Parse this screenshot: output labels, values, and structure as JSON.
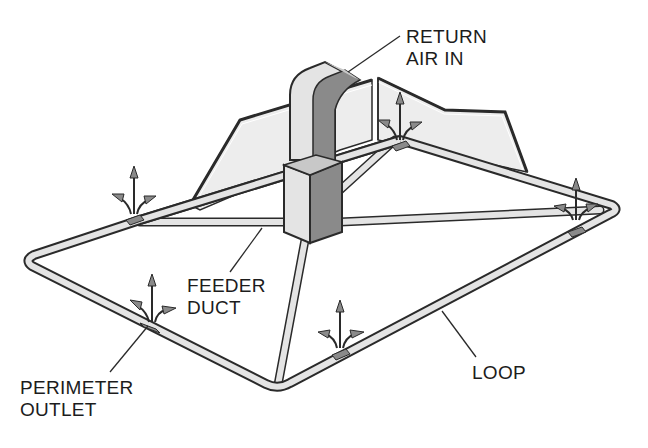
{
  "diagram": {
    "type": "perimeter-loop duct system",
    "labels": {
      "return_air_line1": "RETURN",
      "return_air_line2": "AIR IN",
      "feeder_line1": "FEEDER",
      "feeder_line2": "DUCT",
      "perimeter_line1": "PERIMETER",
      "perimeter_line2": "OUTLET",
      "loop": "LOOP"
    },
    "components": [
      "return air duct",
      "furnace plenum",
      "feeder ducts",
      "perimeter loop",
      "perimeter outlets"
    ],
    "outlet_count": 5,
    "colors": {
      "outline": "#2a2a2a",
      "light_fill": "#e4e4e4",
      "mid_fill": "#c8c8c8",
      "dark_fill": "#8a8a8a",
      "wall_fill": "#ededed",
      "background": "#ffffff"
    }
  }
}
